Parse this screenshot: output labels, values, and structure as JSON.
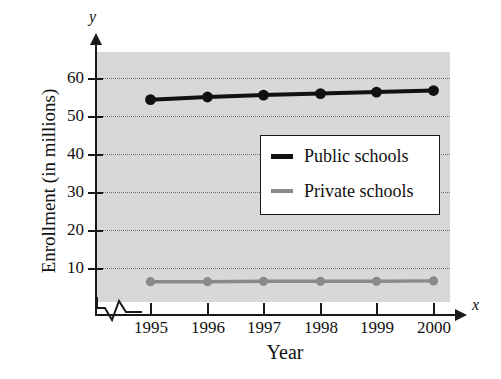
{
  "chart_data": {
    "type": "line",
    "title": "",
    "xlabel": "Year",
    "ylabel": "Enrollment (in millions)",
    "x_axis_letter": "x",
    "y_axis_letter": "y",
    "categories": [
      "1995",
      "1996",
      "1997",
      "1998",
      "1999",
      "2000"
    ],
    "xlim": [
      1994.6,
      2000.5
    ],
    "ylim": [
      0,
      68
    ],
    "y_ticks": [
      10,
      20,
      30,
      40,
      50,
      60
    ],
    "y_tick_labels": [
      "10",
      "20",
      "30",
      "40",
      "50",
      "60"
    ],
    "grid": true,
    "grid_style": "dotted-horizontal",
    "axis_break": true,
    "legend_position": "center-right-inside",
    "series": [
      {
        "name": "Public schools",
        "color": "#111111",
        "marker": "filled-circle",
        "values": [
          54.3,
          55.0,
          55.5,
          55.9,
          56.3,
          56.7
        ]
      },
      {
        "name": "Private schools",
        "color": "#8a8a8a",
        "marker": "filled-circle",
        "values": [
          6.4,
          6.4,
          6.5,
          6.5,
          6.5,
          6.6
        ]
      }
    ]
  },
  "legend": {
    "items": [
      {
        "label": "Public schools",
        "color": "#111111"
      },
      {
        "label": "Private schools",
        "color": "#8a8a8a"
      }
    ]
  },
  "colors": {
    "plot_background": "#d8d8d8",
    "axis": "#1a1a1a",
    "gridline": "#6e6e6e",
    "public_series": "#111111",
    "private_series": "#8a8a8a",
    "legend_background": "#ffffff"
  }
}
